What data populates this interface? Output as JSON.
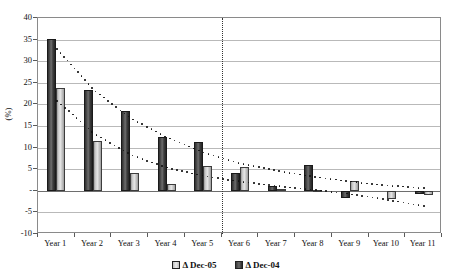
{
  "chart_data": {
    "type": "bar",
    "title": "",
    "subtitle": "",
    "xlabel": "",
    "ylabel": "(%)",
    "ylim": [
      -10,
      40
    ],
    "ytick_step": 5,
    "yticks": [
      40,
      35,
      30,
      25,
      20,
      15,
      10,
      5,
      "-",
      "-5",
      "-10"
    ],
    "ytick_values": [
      40,
      35,
      30,
      25,
      20,
      15,
      10,
      5,
      0,
      -5,
      -10
    ],
    "grid": true,
    "legend_position": "bottom",
    "categories": [
      "Year 1",
      "Year 2",
      "Year 3",
      "Year 4",
      "Year 5",
      "Year 6",
      "Year 7",
      "Year 8",
      "Year 9",
      "Year 10",
      "Year 11"
    ],
    "series": [
      {
        "name": "Δ Dec-05",
        "style": "dark-bar",
        "color": "#3f3f3f",
        "values": [
          35.2,
          23.3,
          18.5,
          12.4,
          11.2,
          4.2,
          1.2,
          6.0,
          -1.6,
          0.0,
          -0.8
        ]
      },
      {
        "name": "Δ Dec-04",
        "style": "light-bar",
        "color": "#d8d8d8",
        "values": [
          23.9,
          11.5,
          4.2,
          1.5,
          5.8,
          5.5,
          0.4,
          0.2,
          2.2,
          -2.0,
          -1.0
        ]
      }
    ],
    "annotations": {
      "divider": {
        "label": "period-divider",
        "between_categories": [
          "Year 5",
          "Year 6"
        ],
        "style": "vertical-dotted-line"
      },
      "trend_curves": [
        {
          "name": "trend-upper",
          "style": "dotted",
          "points": [
            {
              "x": "Year 1",
              "y": 33.0
            },
            {
              "x": "Year 2",
              "y": 23.5
            },
            {
              "x": "Year 3",
              "y": 17.0
            },
            {
              "x": "Year 4",
              "y": 12.5
            },
            {
              "x": "Year 5",
              "y": 9.0
            },
            {
              "x": "Year 6",
              "y": 6.5
            },
            {
              "x": "Year 7",
              "y": 4.8
            },
            {
              "x": "Year 8",
              "y": 3.4
            },
            {
              "x": "Year 9",
              "y": 2.3
            },
            {
              "x": "Year 10",
              "y": 1.4
            },
            {
              "x": "Year 11",
              "y": 0.8
            }
          ]
        },
        {
          "name": "trend-lower",
          "style": "dotted",
          "points": [
            {
              "x": "Year 1",
              "y": 21.0
            },
            {
              "x": "Year 2",
              "y": 13.5
            },
            {
              "x": "Year 3",
              "y": 8.5
            },
            {
              "x": "Year 4",
              "y": 5.5
            },
            {
              "x": "Year 5",
              "y": 3.6
            },
            {
              "x": "Year 6",
              "y": 2.3
            },
            {
              "x": "Year 7",
              "y": 1.3
            },
            {
              "x": "Year 8",
              "y": 0.4
            },
            {
              "x": "Year 9",
              "y": -0.6
            },
            {
              "x": "Year 10",
              "y": -1.9
            },
            {
              "x": "Year 11",
              "y": -3.4
            }
          ]
        }
      ]
    }
  },
  "legend": {
    "entries": [
      {
        "label": "Δ Dec-05",
        "swatch": "light"
      },
      {
        "label": "Δ Dec-04",
        "swatch": "dark"
      }
    ]
  }
}
